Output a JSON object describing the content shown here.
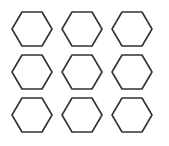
{
  "grid": {
    "rows": 3,
    "cols": 3,
    "shape": "hexagon-icon",
    "stroke_color": "#333333",
    "fill_color": "#ffffff",
    "centers_x": [
      32,
      82,
      132
    ],
    "centers_y": [
      29,
      72,
      115
    ],
    "half_width": 20,
    "half_height": 17
  }
}
